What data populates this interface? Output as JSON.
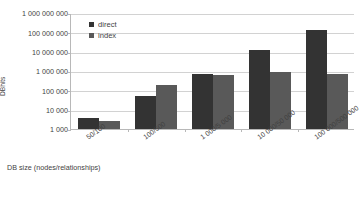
{
  "chart_data": {
    "type": "bar",
    "title": "",
    "xlabel": "DB size (nodes/relationships)",
    "ylabel": "DBhits",
    "yscale": "log",
    "ylim": [
      1000,
      1000000000
    ],
    "grid": true,
    "legend_position": "top-left",
    "categories": [
      "50/100",
      "100/500",
      "1 000/5 000",
      "10 000/50 000",
      "100 000/500 000"
    ],
    "ytick_labels": [
      "1 000 000 000",
      "100 000 000",
      "10 000 000",
      "1 000 000",
      "100 000",
      "10 000",
      "1 000"
    ],
    "ytick_values": [
      1000000000,
      100000000,
      10000000,
      1000000,
      100000,
      10000,
      1000
    ],
    "series": [
      {
        "name": "direct",
        "color": "#333333",
        "values": [
          3500,
          50000,
          700000,
          12000000,
          130000000
        ]
      },
      {
        "name": "index",
        "color": "#595959",
        "values": [
          2500,
          200000,
          600000,
          850000,
          700000
        ]
      }
    ]
  },
  "legend": {
    "items": [
      {
        "label": "direct",
        "color": "#333333"
      },
      {
        "label": "index",
        "color": "#595959"
      }
    ]
  },
  "axes": {
    "x_title": "DB size (nodes/relationships)",
    "y_title": "DBhits"
  },
  "colors": {
    "direct": "#333333",
    "index": "#595959",
    "gridline": "#d2d2d2",
    "axis": "#b8b8b8",
    "text": "#3f3f3f",
    "background": "#ffffff"
  }
}
